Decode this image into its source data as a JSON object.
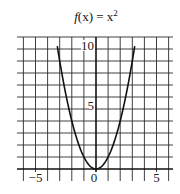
{
  "chart_data": {
    "type": "line",
    "title_parts": {
      "func": "f",
      "arg": "(x)",
      "eq": " = x",
      "sup": "2"
    },
    "xlabel": "",
    "ylabel": "",
    "xlim": [
      -6,
      6
    ],
    "ylim": [
      0,
      10
    ],
    "grid": true,
    "grid_step": 1,
    "x_ticks": [
      {
        "value": -5,
        "label": "−5"
      },
      {
        "value": 0,
        "label": "0"
      },
      {
        "value": 5,
        "label": "5"
      }
    ],
    "y_ticks": [
      {
        "value": 5,
        "label": "5"
      },
      {
        "value": 10,
        "label": "10"
      }
    ],
    "series": [
      {
        "name": "f(x) = x^2",
        "color": "#111111",
        "x": [
          -3.2,
          -3,
          -2.5,
          -2,
          -1.5,
          -1,
          -0.5,
          0,
          0.5,
          1,
          1.5,
          2,
          2.5,
          3,
          3.2
        ],
        "y": [
          10.24,
          9,
          6.25,
          4,
          2.25,
          1,
          0.25,
          0,
          0.25,
          1,
          2.25,
          4,
          6.25,
          9,
          10.24
        ]
      }
    ]
  },
  "colors": {
    "grid": "#2a2a2a",
    "axis": "#111111",
    "curve": "#111111",
    "background": "#ffffff"
  }
}
